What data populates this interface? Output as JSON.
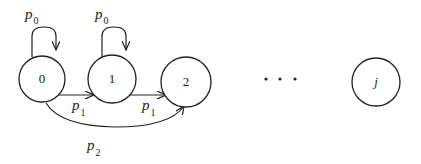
{
  "diagram": {
    "type": "state-transition",
    "nodes": [
      {
        "id": "0",
        "label": "0"
      },
      {
        "id": "1",
        "label": "1"
      },
      {
        "id": "2",
        "label": "2"
      },
      {
        "id": "j",
        "label": "j"
      }
    ],
    "ellipsis": "...",
    "edges": [
      {
        "from": "0",
        "to": "0",
        "label": "p",
        "sub": "0"
      },
      {
        "from": "1",
        "to": "1",
        "label": "p",
        "sub": "0"
      },
      {
        "from": "0",
        "to": "1",
        "label": "p",
        "sub": "1"
      },
      {
        "from": "1",
        "to": "2",
        "label": "p",
        "sub": "1"
      },
      {
        "from": "0",
        "to": "2",
        "label": "p",
        "sub": "2"
      }
    ]
  }
}
